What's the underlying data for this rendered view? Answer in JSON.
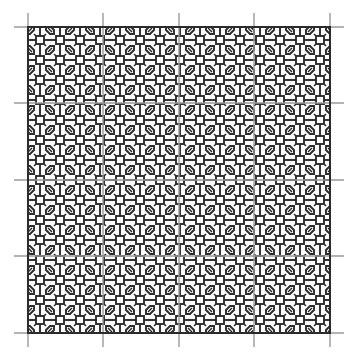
{
  "document": {
    "title": "Blackwork Embroidery Pattern Chart",
    "type": "counted-thread pattern chart",
    "background_color": "#ffffff",
    "stitch_color": "#2b2b2b",
    "graph_grid_color": "#d2d2d2",
    "guide_line_color": "#9a9a9a"
  },
  "canvas": {
    "width": 351,
    "height": 358
  },
  "pattern_area": {
    "x": 28,
    "y": 27,
    "width": 302,
    "height": 306,
    "border_color": "#2b2b2b",
    "border_width": 2
  },
  "graph_grid": {
    "cell_size": 10,
    "line_color": "#d9d9d9",
    "line_width": 0.6,
    "visible": true
  },
  "guide_lines": {
    "color": "#9a9a9a",
    "line_width": 1.4,
    "overhang": 14,
    "vertical_x": [
      28,
      103,
      179,
      254,
      330
    ],
    "horizontal_y": [
      27,
      103,
      180,
      256,
      333
    ]
  },
  "motif": {
    "name": "four-petal-rosette-lattice",
    "repeat_size": 40,
    "columns": 7.5,
    "rows": 7.65,
    "elements": [
      {
        "name": "lattice-square",
        "shape": "square",
        "size": 8,
        "stroke": 2.0
      },
      {
        "name": "petal-outline",
        "shape": "elongated-hexagon",
        "length": 18,
        "stroke": 1.8,
        "orientations": [
          45,
          135,
          225,
          315
        ]
      },
      {
        "name": "petal-vein",
        "shape": "diagonal-line",
        "length": 10,
        "stroke": 1.5
      },
      {
        "name": "connector-bar",
        "shape": "line",
        "stroke": 2.0
      }
    ]
  },
  "chart_data": {
    "type": "heatmap",
    "xlabel": "",
    "ylabel": "",
    "grid": true,
    "legend": "none",
    "categories": [
      "stitched",
      "unstitched"
    ],
    "values": [
      1,
      0
    ]
  }
}
